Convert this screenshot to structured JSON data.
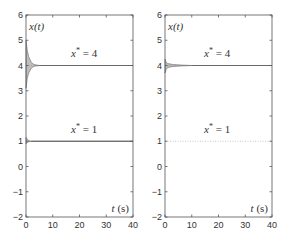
{
  "chart_data": [
    {
      "type": "line",
      "panel": "left",
      "ylabel": "x(t)",
      "xlabel": "t (s)",
      "xlim": [
        0,
        40
      ],
      "ylim": [
        -2,
        6
      ],
      "xticks": [
        "0",
        "10",
        "20",
        "30",
        "40"
      ],
      "yticks": [
        "-2",
        "-1",
        "0",
        "1",
        "2",
        "3",
        "4",
        "5",
        "6"
      ],
      "grid": false,
      "annotations": [
        {
          "text": "x* = 4",
          "x": 18,
          "y": 4.5
        },
        {
          "text": "x* = 1",
          "x": 18,
          "y": 1.5
        }
      ],
      "series": [
        {
          "name": "trajectories converging to x*=4",
          "x": [
            0,
            0.5,
            1,
            2,
            3,
            5,
            40
          ],
          "y_upper": [
            5.0,
            4.6,
            4.35,
            4.12,
            4.04,
            4.0,
            4.0
          ],
          "y_lower": [
            3.1,
            3.5,
            3.7,
            3.9,
            3.97,
            4.0,
            4.0
          ]
        },
        {
          "name": "trajectories converging to x*=1",
          "x": [
            0,
            0.5,
            1,
            2,
            40
          ],
          "y_upper": [
            1.15,
            1.08,
            1.03,
            1.0,
            1.0
          ],
          "y_lower": [
            0.9,
            0.95,
            0.98,
            1.0,
            1.0
          ]
        }
      ]
    },
    {
      "type": "line",
      "panel": "right",
      "ylabel": "x(t)",
      "xlabel": "t (s)",
      "xlim": [
        0,
        40
      ],
      "ylim": [
        -2,
        6
      ],
      "xticks": [
        "0",
        "10",
        "20",
        "30",
        "40"
      ],
      "yticks": [
        "-2",
        "-1",
        "0",
        "1",
        "2",
        "3",
        "4",
        "5",
        "6"
      ],
      "grid": false,
      "annotations": [
        {
          "text": "x* = 4",
          "x": 18,
          "y": 4.5
        },
        {
          "text": "x* = 1",
          "x": 18,
          "y": 1.5
        }
      ],
      "series": [
        {
          "name": "trajectories converging to x*=4",
          "x": [
            0,
            0.5,
            1,
            3,
            6,
            10,
            40
          ],
          "y_upper": [
            4.25,
            4.12,
            4.08,
            4.04,
            4.02,
            4.0,
            4.0
          ],
          "y_lower": [
            3.7,
            3.85,
            3.92,
            3.96,
            3.98,
            4.0,
            4.0
          ]
        },
        {
          "name": "reference x*=1",
          "x": [
            0,
            40
          ],
          "y": [
            1,
            1
          ]
        }
      ]
    }
  ],
  "labels": {
    "ylabel": "x(t)",
    "xlabel_t": "t",
    "xlabel_unit": "(s)",
    "eq4": "x* = 4",
    "eq1": "x* = 1"
  }
}
